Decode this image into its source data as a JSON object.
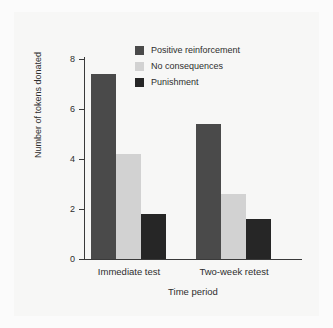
{
  "chart_data": {
    "type": "bar",
    "title": "",
    "xlabel": "Time period",
    "ylabel": "Number of tokens donated",
    "categories": [
      "Immediate test",
      "Two-week retest"
    ],
    "series": [
      {
        "name": "Positive reinforcement",
        "values": [
          7.4,
          5.4
        ],
        "color": "#4a4a4a"
      },
      {
        "name": "No consequences",
        "values": [
          4.2,
          2.6
        ],
        "color": "#d2d2d2"
      },
      {
        "name": "Punishment",
        "values": [
          1.8,
          1.6
        ],
        "color": "#262626"
      }
    ],
    "ylim": [
      0,
      8
    ],
    "yticks": [
      0,
      2,
      4,
      6,
      8
    ],
    "ytick_labels": [
      "0",
      "2",
      "4",
      "6",
      "8"
    ],
    "grid": false,
    "legend_position": "upper center"
  },
  "axes": {
    "y_tick_0": "0",
    "y_tick_1": "2",
    "y_tick_2": "4",
    "y_tick_3": "6",
    "y_tick_4": "8",
    "y_title": "Number of tokens donated",
    "x_title": "Time period",
    "cat_0": "Immediate test",
    "cat_1": "Two-week retest"
  },
  "legend": {
    "items": [
      {
        "label": "Positive reinforcement"
      },
      {
        "label": "No consequences"
      },
      {
        "label": "Punishment"
      }
    ]
  },
  "colors": {
    "positive_reinforcement": "#4a4a4a",
    "no_consequences": "#d2d2d2",
    "punishment": "#262626",
    "axis": "#3a3a3a",
    "text": "#2e2e2e",
    "background": "#f7f7f6"
  }
}
